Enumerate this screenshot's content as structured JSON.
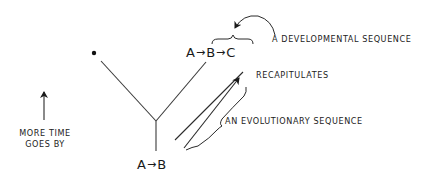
{
  "diagram": {
    "type": "evolutionary-tree-recapitulation",
    "top_sequence": {
      "items": [
        "A",
        "B",
        "C"
      ],
      "arrow_glyph": "→"
    },
    "bottom_sequence": {
      "items": [
        "A",
        "B"
      ],
      "arrow_glyph": "→"
    },
    "labels": {
      "developmental_sequence": "A DEVELOPMENTAL SEQUENCE",
      "recapitulates": "RECAPITULATES",
      "evolutionary_sequence": "AN EVOLUTIONARY SEQUENCE",
      "time_line1": "MORE TIME",
      "time_line2": "GOES BY"
    },
    "colors": {
      "ink": "#1a1a1a",
      "line": "#3a3a3a",
      "background": "#ffffff"
    }
  }
}
